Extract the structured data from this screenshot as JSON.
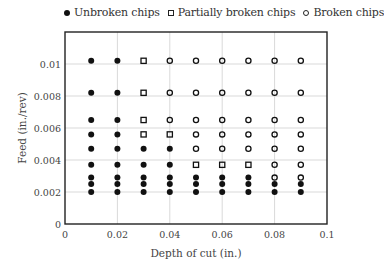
{
  "chart_data": {
    "type": "scatter",
    "title": "",
    "xlabel": "Depth of cut (in.)",
    "ylabel": "Feed (in./rev)",
    "xlim": [
      0,
      0.1
    ],
    "ylim": [
      0,
      0.012
    ],
    "xticks": [
      "0",
      "0.02",
      "0.04",
      "0.06",
      "0.08",
      "0.1"
    ],
    "yticks": [
      "0",
      "0.002",
      "0.004",
      "0.006",
      "0.008",
      "0.01"
    ],
    "grid": true,
    "legend_position": "top",
    "x": [
      0.01,
      0.02,
      0.03,
      0.04,
      0.05,
      0.06,
      0.07,
      0.08,
      0.09
    ],
    "feed_levels": [
      0.0102,
      0.0082,
      0.0065,
      0.0056,
      0.0047,
      0.0037,
      0.0029,
      0.0025,
      0.002
    ],
    "classification_grid": [
      [
        "U",
        "U",
        "P",
        "B",
        "B",
        "B",
        "B",
        "B",
        "B"
      ],
      [
        "U",
        "U",
        "P",
        "B",
        "B",
        "B",
        "B",
        "B",
        "B"
      ],
      [
        "U",
        "U",
        "P",
        "B",
        "B",
        "B",
        "B",
        "B",
        "B"
      ],
      [
        "U",
        "U",
        "P",
        "P",
        "B",
        "B",
        "B",
        "B",
        "B"
      ],
      [
        "U",
        "U",
        "U",
        "U",
        "B",
        "B",
        "B",
        "B",
        "B"
      ],
      [
        "U",
        "U",
        "U",
        "U",
        "P",
        "P",
        "P",
        "B",
        "B"
      ],
      [
        "U",
        "U",
        "U",
        "U",
        "U",
        "U",
        "U",
        "B",
        "B"
      ],
      [
        "U",
        "U",
        "U",
        "U",
        "U",
        "U",
        "U",
        "U",
        "U"
      ],
      [
        "U",
        "U",
        "U",
        "U",
        "U",
        "U",
        "U",
        "U",
        "U"
      ]
    ],
    "series": [
      {
        "name": "Unbroken chips",
        "code": "U",
        "marker": "filled-circle"
      },
      {
        "name": "Partially broken chips",
        "code": "P",
        "marker": "open-square"
      },
      {
        "name": "Broken chips",
        "code": "B",
        "marker": "open-circle"
      }
    ]
  },
  "legend": {
    "unbroken": "Unbroken chips",
    "partial": "Partially broken chips",
    "broken": "Broken chips"
  },
  "axes": {
    "xlabel": "Depth of cut (in.)",
    "ylabel": "Feed (in./rev)"
  },
  "colors": {
    "marker": "#111111",
    "grid": "#d9d9d9",
    "frame": "#222222"
  }
}
